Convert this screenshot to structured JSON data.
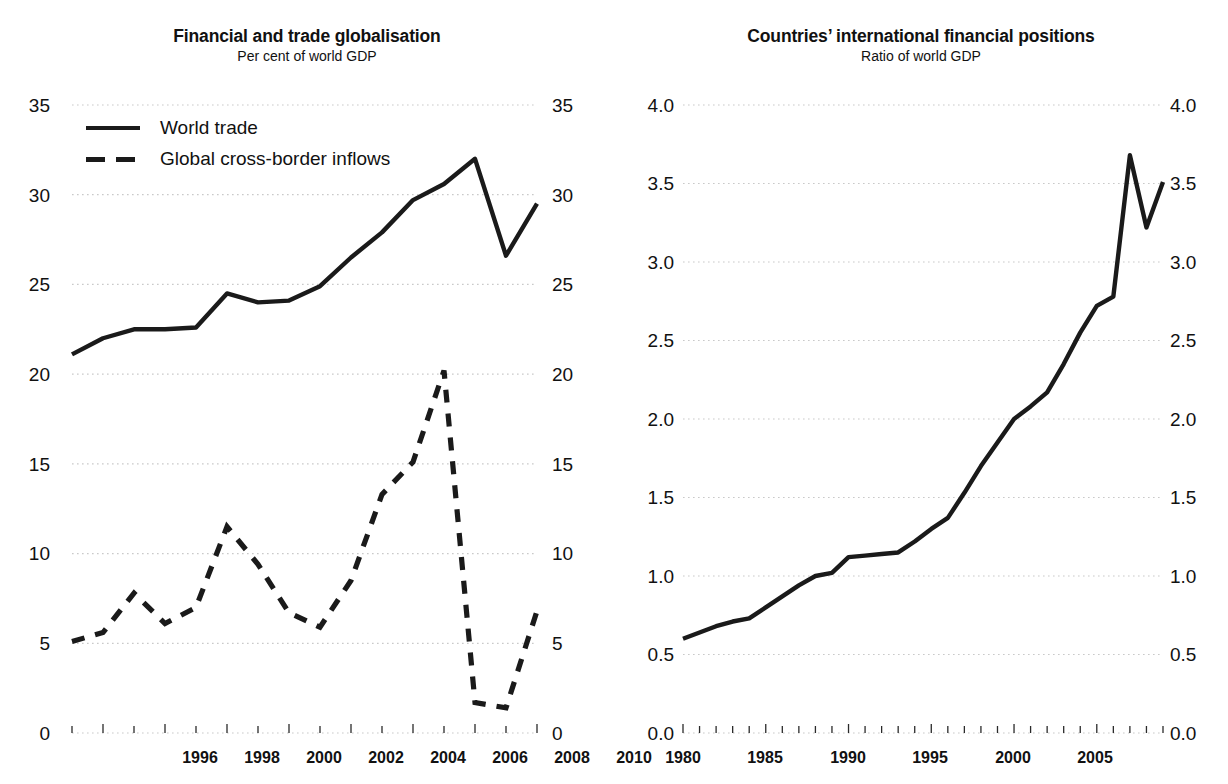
{
  "panels": [
    {
      "id": "financial-trade-globalisation",
      "title": "Financial and trade globalisation",
      "subtitle": "Per cent of world GDP",
      "legend": [
        {
          "label": "World trade",
          "style": "solid"
        },
        {
          "label": "Global cross-border inflows",
          "style": "dashed"
        }
      ],
      "y_ticks": [
        "35",
        "30",
        "25",
        "20",
        "15",
        "10",
        "5",
        "0"
      ],
      "x_ticks": [
        "1996",
        "1998",
        "2000",
        "2002",
        "2004",
        "2006",
        "2008",
        "2010"
      ]
    },
    {
      "id": "countries-international-financial-positions",
      "title": "Countries’ international financial positions",
      "subtitle": "Ratio of world GDP",
      "legend": [],
      "y_ticks": [
        "4.0",
        "3.5",
        "3.0",
        "2.5",
        "2.0",
        "1.5",
        "1.0",
        "0.5",
        "0.0"
      ],
      "x_ticks": [
        "1980",
        "1985",
        "1990",
        "1995",
        "2000",
        "2005"
      ]
    }
  ],
  "colors": {
    "line": "#1a1a1a",
    "grid": "#c9c9c9",
    "text": "#111111",
    "background": "#ffffff"
  },
  "chart_data": [
    {
      "type": "line",
      "title": "Financial and trade globalisation",
      "subtitle": "Per cent of world GDP",
      "xlabel": "",
      "ylabel": "Per cent of world GDP",
      "xlim": [
        1995,
        2010
      ],
      "ylim": [
        0,
        35
      ],
      "ytick_values": [
        0,
        5,
        10,
        15,
        20,
        25,
        30,
        35
      ],
      "xtick_values": [
        1996,
        1998,
        2000,
        2002,
        2004,
        2006,
        2008,
        2010
      ],
      "grid": true,
      "legend_position": "top-left",
      "x": [
        1995,
        1996,
        1997,
        1998,
        1999,
        2000,
        2001,
        2002,
        2003,
        2004,
        2005,
        2006,
        2007,
        2008,
        2009,
        2010
      ],
      "series": [
        {
          "name": "World trade",
          "style": "solid",
          "values": [
            21.1,
            22.0,
            22.5,
            22.5,
            22.6,
            24.5,
            24.0,
            24.1,
            24.9,
            26.5,
            27.9,
            29.7,
            30.6,
            32.0,
            26.6,
            29.5
          ]
        },
        {
          "name": "Global cross-border inflows",
          "style": "dashed",
          "values": [
            5.1,
            5.6,
            7.8,
            6.1,
            7.0,
            11.5,
            9.4,
            6.7,
            5.9,
            8.5,
            13.3,
            15.1,
            20.2,
            1.7,
            1.4,
            6.8
          ]
        }
      ]
    },
    {
      "type": "line",
      "title": "Countries’ international financial positions",
      "subtitle": "Ratio of world GDP",
      "xlabel": "",
      "ylabel": "Ratio of world GDP",
      "xlim": [
        1980,
        2009
      ],
      "ylim": [
        0.0,
        4.0
      ],
      "ytick_values": [
        0.0,
        0.5,
        1.0,
        1.5,
        2.0,
        2.5,
        3.0,
        3.5,
        4.0
      ],
      "xtick_values": [
        1980,
        1985,
        1990,
        1995,
        2000,
        2005
      ],
      "grid": true,
      "legend_position": "none",
      "x": [
        1980,
        1981,
        1982,
        1983,
        1984,
        1985,
        1986,
        1987,
        1988,
        1989,
        1990,
        1991,
        1992,
        1993,
        1994,
        1995,
        1996,
        1997,
        1998,
        1999,
        2000,
        2001,
        2002,
        2003,
        2004,
        2005,
        2006,
        2007,
        2008,
        2009
      ],
      "series": [
        {
          "name": "International financial positions",
          "style": "solid",
          "values": [
            0.6,
            0.64,
            0.68,
            0.71,
            0.73,
            0.8,
            0.87,
            0.94,
            1.0,
            1.02,
            1.12,
            1.13,
            1.14,
            1.15,
            1.22,
            1.3,
            1.37,
            1.53,
            1.7,
            1.85,
            2.0,
            2.08,
            2.17,
            2.35,
            2.55,
            2.72,
            2.78,
            3.68,
            3.22,
            3.51
          ]
        }
      ]
    }
  ]
}
